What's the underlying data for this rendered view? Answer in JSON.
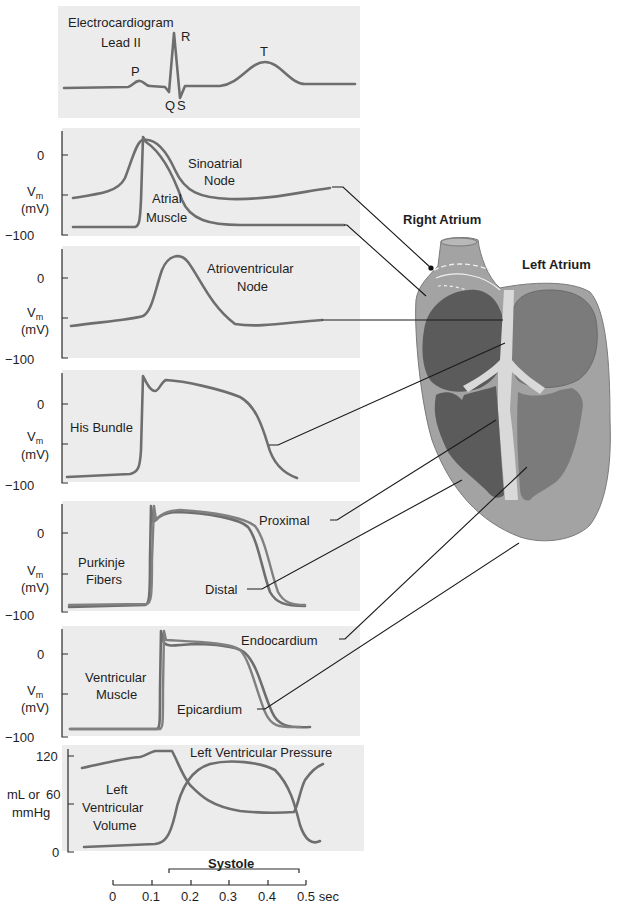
{
  "figure": {
    "panels": {
      "ecg": {
        "title_line1": "Electrocardiogram",
        "title_line2": "Lead II",
        "waves": {
          "p": "P",
          "q": "Q",
          "r": "R",
          "s": "S",
          "t": "T"
        }
      },
      "sa_atrial": {
        "y_label": "V",
        "y_sub": "m",
        "y_unit": "(mV)",
        "ticks": [
          "0",
          "−100"
        ],
        "label_sa_1": "Sinoatrial",
        "label_sa_2": "Node",
        "label_atrial_1": "Atrial",
        "label_atrial_2": "Muscle"
      },
      "av_node": {
        "y_label": "V",
        "y_sub": "m",
        "y_unit": "(mV)",
        "ticks": [
          "0",
          "−100"
        ],
        "label_1": "Atrioventricular",
        "label_2": "Node"
      },
      "his_bundle": {
        "y_label": "V",
        "y_sub": "m",
        "y_unit": "(mV)",
        "ticks": [
          "0",
          "−100"
        ],
        "label": "His Bundle"
      },
      "purkinje": {
        "y_label": "V",
        "y_sub": "m",
        "y_unit": "(mV)",
        "ticks": [
          "0",
          "−100"
        ],
        "label_1": "Purkinje",
        "label_2": "Fibers",
        "proximal": "Proximal",
        "distal": "Distal"
      },
      "ventricular": {
        "y_label": "V",
        "y_sub": "m",
        "y_unit": "(mV)",
        "ticks": [
          "0",
          "−100"
        ],
        "label_1": "Ventricular",
        "label_2": "Muscle",
        "endocardium": "Endocardium",
        "epicardium": "Epicardium"
      },
      "lv": {
        "y_label_1": "mL or",
        "y_label_2": "mmHg",
        "ticks": [
          "120",
          "60",
          "0"
        ],
        "pressure": "Left Ventricular Pressure",
        "volume_1": "Left",
        "volume_2": "Ventricular",
        "volume_3": "Volume"
      }
    },
    "time_axis": {
      "systole": "Systole",
      "ticks": [
        "0",
        "0.1",
        "0.2",
        "0.3",
        "0.4",
        "0.5 sec"
      ]
    },
    "heart": {
      "right_atrium": "Right Atrium",
      "left_atrium": "Left Atrium"
    },
    "colors": {
      "panel_bg": "#ececec",
      "curve": "#6e6e6e",
      "heart_wall": "#9c9c9c",
      "right_chambers": "#5a5a5a",
      "left_chambers": "#7a7a7a",
      "septum": "#d8d8d8"
    }
  }
}
